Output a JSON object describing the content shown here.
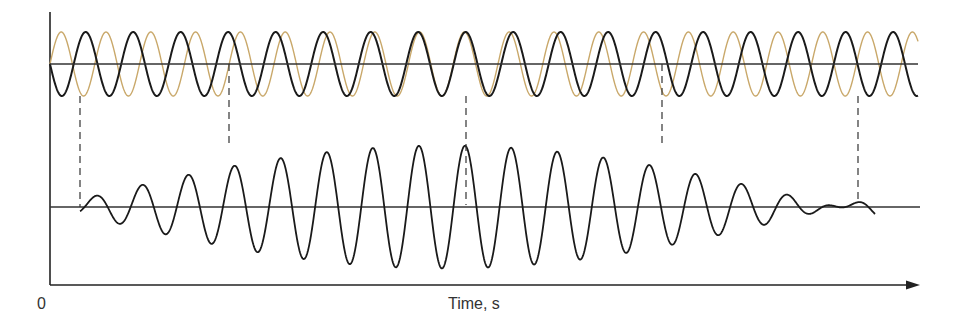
{
  "figure": {
    "x_axis": {
      "origin_label": "0",
      "label": "Time, s"
    },
    "colors": {
      "wave_a": "#1a1a1a",
      "wave_b": "#c9a86a",
      "axes": "#222222",
      "baseline": "#333333",
      "dashed": "#333333",
      "background": "#ffffff"
    },
    "top_panel": {
      "baseline_y": 64,
      "amplitude": 32,
      "x_start": 50,
      "x_end": 918,
      "wave_a": {
        "name": "black wave",
        "period_px": 47.5,
        "phase_px": 50,
        "start_sign": -1
      },
      "wave_b": {
        "name": "orange wave",
        "period_px": 44.8,
        "phase_px": 50,
        "start_sign": 1
      }
    },
    "bottom_panel": {
      "baseline_y": 207,
      "baseline_x_start": 50,
      "baseline_x_end": 920,
      "wave_x_start": 80,
      "wave_x_end": 875,
      "amplitude_scale": 0.96
    },
    "dashed_lines": [
      {
        "x": 80,
        "y1": 96,
        "y2": 207
      },
      {
        "x": 229,
        "y1": 64,
        "y2": 143
      },
      {
        "x": 466,
        "y1": 96,
        "y2": 205
      },
      {
        "x": 662,
        "y1": 64,
        "y2": 143
      },
      {
        "x": 858,
        "y1": 96,
        "y2": 200
      }
    ],
    "axes": {
      "y_axis_x": 50,
      "y_axis_top": 12,
      "x_axis_y": 285,
      "x_axis_end": 920
    }
  }
}
